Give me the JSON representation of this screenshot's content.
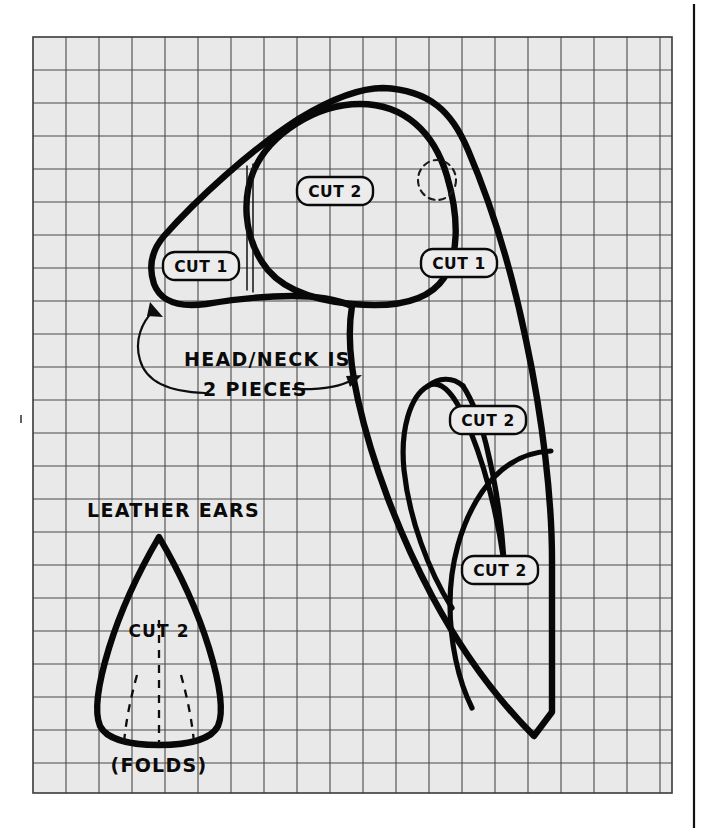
{
  "document": {
    "kind": "sewing-pattern-grid-diagram",
    "description": "Hand-drawn dog toy / soft-toy pattern pieces laid out on a square grid"
  },
  "grid": {
    "cell_size_px": 33,
    "columns": 19,
    "rows": 22,
    "background_color": "#e9e9e9",
    "line_color": "#4a4a4a",
    "border_color": "#3a3a3a"
  },
  "colors": {
    "ink": "#0a0a0a",
    "paper": "#ffffff",
    "grid_fill": "#e9e9e9",
    "grid_rule": "#4a4a4a"
  },
  "labels": {
    "body_cut1_left": "CUT 1",
    "body_cut1_right": "CUT 1",
    "head_cut2": "CUT 2",
    "gusset_cut2_upper": "CUT 2",
    "gusset_cut2_lower": "CUT 2",
    "ear_cut2": "CUT 2"
  },
  "annotations": {
    "head_neck_line1": "HEAD/NECK IS",
    "head_neck_line2": "2 PIECES",
    "leather_ears": "LEATHER EARS",
    "folds": "(FOLDS)"
  },
  "pieces": [
    {
      "id": "body-main",
      "name": "body / head outline",
      "cut_label": "CUT 1",
      "quantity": 1
    },
    {
      "id": "head-panel",
      "name": "head panel",
      "cut_label": "CUT 2",
      "quantity": 2
    },
    {
      "id": "neck-gusset-upper",
      "name": "upper gusset",
      "cut_label": "CUT 2",
      "quantity": 2
    },
    {
      "id": "neck-gusset-lower",
      "name": "lower gusset",
      "cut_label": "CUT 2",
      "quantity": 2
    },
    {
      "id": "leather-ear",
      "name": "leather ear",
      "cut_label": "CUT 2",
      "quantity": 2
    }
  ]
}
